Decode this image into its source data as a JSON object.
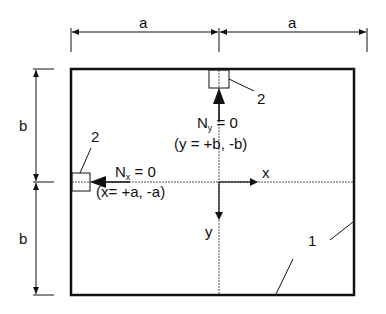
{
  "diagram": {
    "type": "plate-boundary-conditions",
    "colors": {
      "line": "#111111",
      "background": "#ffffff"
    },
    "dimensions": {
      "top_left_label": "a",
      "top_right_label": "a",
      "left_top_label": "b",
      "left_bottom_label": "b"
    },
    "axes": {
      "x_label": "x",
      "y_label": "y"
    },
    "annotations": {
      "ny_main": "N",
      "ny_sub": "y",
      "ny_eq": " = 0",
      "ny_condition": "(y = +b, -b)",
      "nx_main": "N",
      "nx_sub": "x",
      "nx_eq": " = 0",
      "nx_condition": "(x= +a, -a)"
    },
    "callouts": {
      "plate_label": "1",
      "support_top_label": "2",
      "support_left_label": "2"
    }
  }
}
